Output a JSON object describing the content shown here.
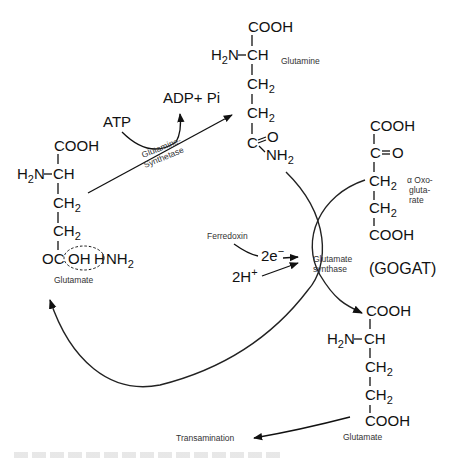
{
  "glutamine": {
    "name": "Glutamine",
    "cooh": "COOH",
    "h2n": "H",
    "h2n_sub": "2",
    "h2n_rest": "N",
    "ch": "CH",
    "ch2a": "CH",
    "ch2b": "CH",
    "two": "2",
    "c": "C",
    "o": "O",
    "nh": "NH",
    "nh_sub": "2"
  },
  "glutamate_left": {
    "name": "Glutamate",
    "cooh": "COOH",
    "h2n": "H",
    "h2n_sub": "2",
    "h2n_rest": "N",
    "ch": "CH",
    "ch2a": "CH",
    "ch2b": "CH",
    "two": "2",
    "oc": "OC",
    "oh": "OH",
    "h": "H",
    "nh": "NH",
    "nh_sub": "2"
  },
  "oxoglutarate": {
    "name_line1": "α Oxo-",
    "name_line2": "gluta-",
    "name_line3": "rate",
    "cooh_top": "COOH",
    "c": "C",
    "o": "O",
    "ch2a": "CH",
    "ch2b": "CH",
    "two": "2",
    "cooh_bottom": "COOH"
  },
  "glutamate_right": {
    "name": "Glutamate",
    "cooh_top": "COOH",
    "h2n": "H",
    "h2n_sub": "2",
    "h2n_rest": "N",
    "ch": "CH",
    "ch2a": "CH",
    "ch2b": "CH",
    "two": "2",
    "cooh_bottom": "COOH"
  },
  "reaction1": {
    "atp": "ATP",
    "adp": "ADP+ Pi",
    "enzyme_line1": "Glutamine-",
    "enzyme_line2": "Synthetase"
  },
  "reaction2": {
    "ferredoxin": "Ferredoxin",
    "electrons": "2e",
    "electrons_sup": "−",
    "protons": "2H",
    "protons_sup": "+",
    "enzyme_line1": "Glutamate",
    "enzyme_line2": "synthase",
    "abbrev": "(GOGAT)"
  },
  "output": {
    "transamination": "Transamination"
  }
}
